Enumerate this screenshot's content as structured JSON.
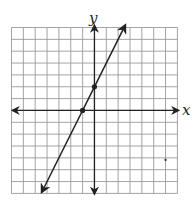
{
  "chart_data": {
    "type": "line",
    "title": "",
    "xlabel": "x",
    "ylabel": "y",
    "xlim": [
      -7,
      7
    ],
    "ylim": [
      -7,
      7
    ],
    "grid": true,
    "grid_cells": 14,
    "series": [
      {
        "name": "line",
        "equation": "y = 2x + 2",
        "slope": 2,
        "intercept": 2,
        "marked_points": [
          [
            -1,
            0
          ],
          [
            0,
            2
          ]
        ]
      }
    ],
    "stray_mark": [
      6,
      -4
    ]
  },
  "labels": {
    "x": "x",
    "y": "y"
  },
  "colors": {
    "grid": "#9a9a9a",
    "axis": "#222222",
    "line": "#222222",
    "background": "#ffffff"
  }
}
